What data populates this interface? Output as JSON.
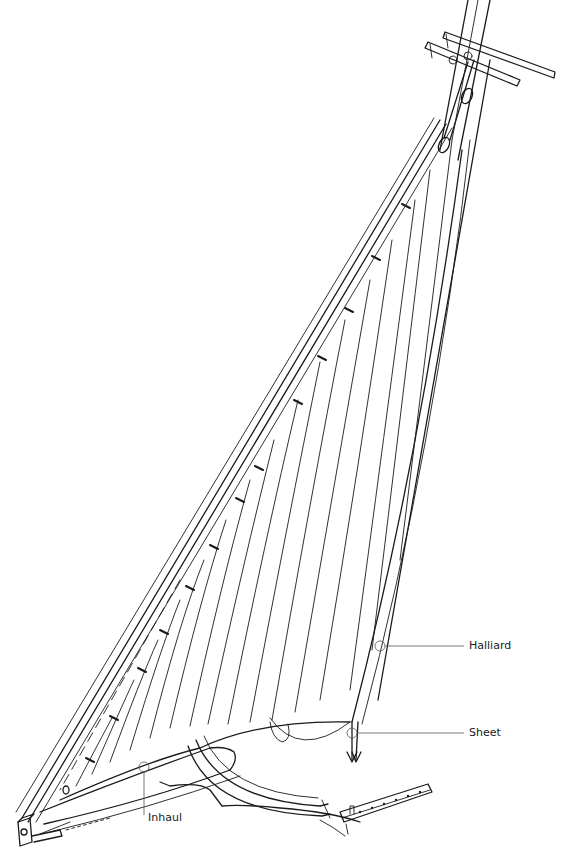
{
  "diagram": {
    "colors": {
      "ink": "#1a1a1a",
      "callout": "#555555",
      "background": "#ffffff"
    },
    "labels": [
      {
        "id": "halliard",
        "text": "Halliard"
      },
      {
        "id": "sheet",
        "text": "Sheet"
      },
      {
        "id": "inhaul",
        "text": "Inhaul"
      }
    ]
  }
}
